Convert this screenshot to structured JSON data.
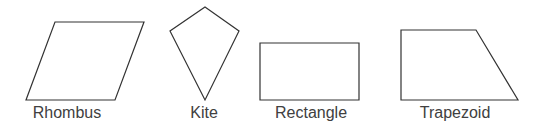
{
  "shapes": [
    {
      "name": "Rhombus",
      "points": "55,22 144,22 115,100 26,100",
      "label_x": 67
    },
    {
      "name": "Kite",
      "points": "205,7 239,31 205,100 170,31",
      "label_x": 204
    },
    {
      "name": "Rectangle",
      "points": "260,43 359,43 359,100 260,100",
      "label_x": 311
    },
    {
      "name": "Trapezoid",
      "points": "401,30 476,30 518,100 401,100",
      "label_x": 455
    }
  ],
  "colors": {
    "stroke": "#333333",
    "label": "#404040"
  }
}
